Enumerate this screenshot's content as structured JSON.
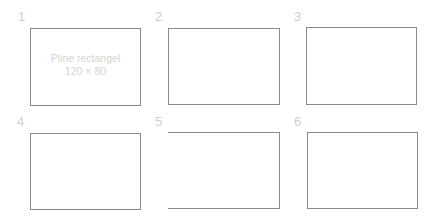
{
  "panels": [
    {
      "label": "1",
      "label_pos": {
        "x": 18,
        "y": 10
      },
      "rect": {
        "x": 30,
        "y": 28,
        "w": 111,
        "h": 78
      },
      "caption_line1": "Pline rectangel",
      "caption_line2": "120 × 80",
      "open_left": false
    },
    {
      "label": "2",
      "label_pos": {
        "x": 155,
        "y": 10
      },
      "rect": {
        "x": 168,
        "y": 28,
        "w": 112,
        "h": 77
      },
      "open_left": false
    },
    {
      "label": "3",
      "label_pos": {
        "x": 294,
        "y": 10
      },
      "rect": {
        "x": 306,
        "y": 27,
        "w": 111,
        "h": 78
      },
      "open_left": false
    },
    {
      "label": "4",
      "label_pos": {
        "x": 17,
        "y": 115
      },
      "rect": {
        "x": 30,
        "y": 133,
        "w": 111,
        "h": 77
      },
      "open_left": false
    },
    {
      "label": "5",
      "label_pos": {
        "x": 155,
        "y": 115
      },
      "rect": {
        "x": 168,
        "y": 132,
        "w": 112,
        "h": 77
      },
      "open_left": true
    },
    {
      "label": "6",
      "label_pos": {
        "x": 294,
        "y": 115
      },
      "rect": {
        "x": 307,
        "y": 132,
        "w": 111,
        "h": 77
      },
      "open_left": false
    }
  ],
  "colors": {
    "stroke": "#8a8a8a",
    "label": "#cfcfcf",
    "caption": "#d4d4d4"
  }
}
